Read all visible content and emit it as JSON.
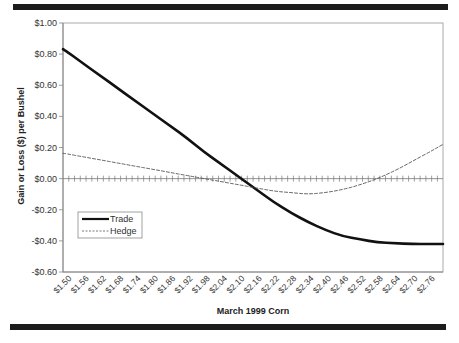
{
  "chart_data": {
    "type": "line",
    "title": "",
    "xlabel": "March 1999 Corn",
    "ylabel": "Gain or Loss ($) per Bushel",
    "ylim": [
      -0.6,
      1.0
    ],
    "yticks": [
      "$1.00",
      "$0.80",
      "$0.60",
      "$0.40",
      "$0.20",
      "$0.00",
      "-$0.20",
      "-$0.40",
      "-$0.60"
    ],
    "ytick_values": [
      1.0,
      0.8,
      0.6,
      0.4,
      0.2,
      0.0,
      -0.2,
      -0.4,
      -0.6
    ],
    "categories": [
      "$1.50",
      "$1.56",
      "$1.62",
      "$1.68",
      "$1.74",
      "$1.80",
      "$1.86",
      "$1.92",
      "$1.98",
      "$2.04",
      "$2.10",
      "$2.16",
      "$2.22",
      "$2.28",
      "$2.34",
      "$2.40",
      "$2.46",
      "$2.52",
      "$2.58",
      "$2.64",
      "$2.70",
      "$2.76"
    ],
    "series": [
      {
        "name": "Trade",
        "style": "solid",
        "values": [
          0.82,
          0.74,
          0.66,
          0.58,
          0.5,
          0.42,
          0.34,
          0.26,
          0.17,
          0.09,
          0.01,
          -0.07,
          -0.15,
          -0.22,
          -0.28,
          -0.33,
          -0.37,
          -0.39,
          -0.41,
          -0.415,
          -0.42,
          -0.42
        ]
      },
      {
        "name": "Hedge",
        "style": "dashed",
        "values": [
          0.16,
          0.14,
          0.12,
          0.1,
          0.08,
          0.06,
          0.04,
          0.02,
          0.0,
          -0.02,
          -0.04,
          -0.06,
          -0.08,
          -0.09,
          -0.1,
          -0.09,
          -0.07,
          -0.04,
          0.0,
          0.05,
          0.11,
          0.17
        ]
      }
    ],
    "grid": false,
    "legend_position": "lower-left inside plot",
    "zero_line_minor_ticks": true
  },
  "colors": {
    "trade": "#111111",
    "hedge": "#555555",
    "axis": "#999999",
    "rule": "#1c1c1c"
  }
}
